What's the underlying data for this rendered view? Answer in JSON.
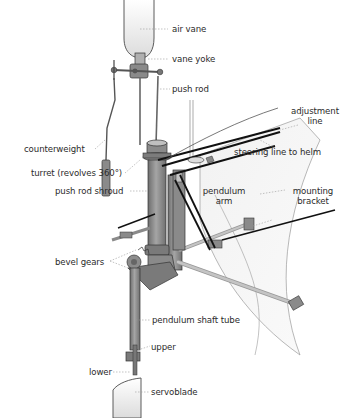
{
  "diagram": {
    "colors": {
      "metal": "#8e8e8e",
      "metal_dark": "#6a6a6a",
      "metal_light": "#b5b5b5",
      "vane": "#eeeeee",
      "line": "#111111",
      "leader": "#9a9a9a",
      "text": "#2b2b2b"
    },
    "labels": {
      "air_vane": "air vane",
      "vane_yoke": "vane yoke",
      "push_rod": "push rod",
      "adjustment_line_1": "adjustment",
      "adjustment_line_2": "line",
      "counterweight": "counterweight",
      "turret": "turret (revolves 360°)",
      "steering_line": "steering line to helm",
      "push_rod_shroud": "push rod shroud",
      "pendulum_arm_1": "pendulum",
      "pendulum_arm_2": "arm",
      "mounting_bracket_1": "mounting",
      "mounting_bracket_2": "bracket",
      "bevel_gears": "bevel gears",
      "pendulum_shaft_tube": "pendulum shaft tube",
      "upper": "upper",
      "lower": "lower",
      "servoblade": "servoblade"
    }
  }
}
